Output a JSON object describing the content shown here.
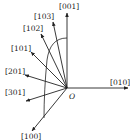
{
  "diagram": {
    "title": "",
    "origin": {
      "label": "O",
      "x": 67,
      "y": 88,
      "label_x": 69,
      "label_y": 99
    },
    "colors": {
      "line": "#222222",
      "background": "#ffffff"
    },
    "directions": [
      {
        "id": "001",
        "label": "[001]",
        "x2": 67,
        "y2": 13,
        "lx": 59,
        "ly": 9
      },
      {
        "id": "103",
        "label": "[103]",
        "x2": 53,
        "y2": 22,
        "lx": 34,
        "ly": 19
      },
      {
        "id": "102",
        "label": "[102]",
        "x2": 41,
        "y2": 34,
        "lx": 23,
        "ly": 31
      },
      {
        "id": "101",
        "label": "[101]",
        "x2": 31,
        "y2": 52,
        "lx": 11,
        "ly": 51
      },
      {
        "id": "201",
        "label": "[201]",
        "x2": 25,
        "y2": 75,
        "lx": 5,
        "ly": 74
      },
      {
        "id": "301",
        "label": "[301]",
        "x2": 26,
        "y2": 101,
        "lx": 5,
        "ly": 95
      },
      {
        "id": "100",
        "label": "[100]",
        "x2": 32,
        "y2": 131,
        "lx": 21,
        "ly": 139
      },
      {
        "id": "010",
        "label": "[010]",
        "x2": 128,
        "y2": 88,
        "lx": 110,
        "ly": 85
      }
    ],
    "arc": {
      "path": "M67,38 C55,38 49,46 47,60 C45,80 44,100 44,118"
    }
  }
}
